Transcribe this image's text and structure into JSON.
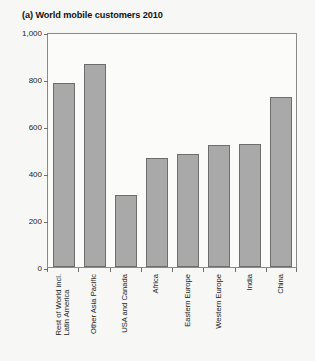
{
  "chart_data": {
    "type": "bar",
    "title": "(a) World mobile customers 2010",
    "xlabel": "",
    "ylabel": "Million",
    "ylim": [
      0,
      1000
    ],
    "yticks": [
      0,
      200,
      400,
      600,
      800,
      1000
    ],
    "ytick_labels": [
      "0",
      "200",
      "400",
      "600",
      "800",
      "1,000"
    ],
    "grid": false,
    "legend": null,
    "bar_color": "#a9a9a9",
    "bar_edge_color": "#6d6d6d",
    "categories": [
      "Rest of World incl.\nLatin America",
      "Other Asia Pacific",
      "USA and Canada",
      "Africa",
      "Eastern Europe",
      "Western Europe",
      "India",
      "China"
    ],
    "category_lines": [
      [
        "Rest of World incl.",
        "Latin America"
      ],
      [
        "Other Asia Pacific"
      ],
      [
        "USA and Canada"
      ],
      [
        "Africa"
      ],
      [
        "Eastern Europe"
      ],
      [
        "Western Europe"
      ],
      [
        "India"
      ],
      [
        "China"
      ]
    ],
    "values": [
      785,
      865,
      305,
      462,
      480,
      518,
      525,
      725
    ]
  }
}
